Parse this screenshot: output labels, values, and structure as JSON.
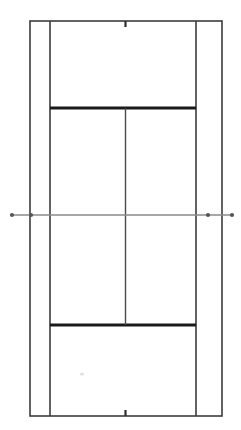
{
  "figure": {
    "orientation": "vertical",
    "surface_color": "#ffffff",
    "line_color": "#3c3c3c",
    "bold_line_color": "#1a1a1a",
    "net_color": "#8a8a8a",
    "canvas": {
      "width": 241,
      "height": 430
    }
  },
  "chart_data": {
    "type": "diagram",
    "view": "overhead-plan",
    "units": "pixels",
    "axis_ranges": {
      "x": [
        0,
        241
      ],
      "y": [
        0,
        430
      ]
    },
    "grid": false,
    "legend": null,
    "court_bounds": {
      "doubles_left_x": 30,
      "doubles_right_x": 222,
      "singles_left_x": 50,
      "singles_right_x": 196,
      "baseline_top_y": 21,
      "baseline_bottom_y": 416,
      "net_y": 215,
      "center_x": 125.5
    },
    "lines": [
      {
        "name": "doubles-sideline-left",
        "kind": "vertical",
        "x": 30,
        "y1": 21,
        "y2": 416,
        "weight": "normal"
      },
      {
        "name": "doubles-sideline-right",
        "kind": "vertical",
        "x": 222,
        "y1": 21,
        "y2": 416,
        "weight": "normal"
      },
      {
        "name": "singles-sideline-left",
        "kind": "vertical",
        "x": 50,
        "y1": 21,
        "y2": 416,
        "weight": "normal"
      },
      {
        "name": "singles-sideline-right",
        "kind": "vertical",
        "x": 196,
        "y1": 21,
        "y2": 416,
        "weight": "normal"
      },
      {
        "name": "baseline-top",
        "kind": "horizontal",
        "y": 21,
        "x1": 30,
        "x2": 222,
        "weight": "normal"
      },
      {
        "name": "baseline-bottom",
        "kind": "horizontal",
        "y": 416,
        "x1": 30,
        "x2": 222,
        "weight": "normal"
      },
      {
        "name": "service-line-top",
        "kind": "horizontal",
        "y": 108,
        "x1": 50,
        "x2": 196,
        "weight": "bold"
      },
      {
        "name": "service-line-bottom",
        "kind": "horizontal",
        "y": 325,
        "x1": 50,
        "x2": 196,
        "weight": "bold"
      },
      {
        "name": "center-service-line",
        "kind": "vertical",
        "x": 125.5,
        "y1": 108,
        "y2": 325,
        "weight": "normal"
      },
      {
        "name": "net-line",
        "kind": "horizontal",
        "y": 215,
        "x1": 12,
        "x2": 233,
        "weight": "net"
      }
    ],
    "center_marks": [
      {
        "name": "center-mark-top",
        "x": 125.5,
        "y1": 21,
        "y2": 27
      },
      {
        "name": "center-mark-bottom",
        "x": 125.5,
        "y1": 410,
        "y2": 416
      }
    ],
    "net_posts": [
      {
        "name": "net-post-outer-left",
        "x": 12,
        "y": 215,
        "r": 2.1
      },
      {
        "name": "net-post-inner-left",
        "x": 31,
        "y": 215,
        "r": 2.1
      },
      {
        "name": "net-post-inner-right",
        "x": 208,
        "y": 215,
        "r": 2.1
      },
      {
        "name": "net-post-outer-right",
        "x": 232,
        "y": 215,
        "r": 2.1
      }
    ],
    "regions": [
      {
        "name": "deuce-court-far",
        "x1": 50,
        "x2": 125.5,
        "y1": 108,
        "y2": 215
      },
      {
        "name": "ad-court-far",
        "x1": 125.5,
        "x2": 196,
        "y1": 108,
        "y2": 215
      },
      {
        "name": "deuce-court-near",
        "x1": 125.5,
        "x2": 196,
        "y1": 215,
        "y2": 325
      },
      {
        "name": "ad-court-near",
        "x1": 50,
        "x2": 125.5,
        "y1": 215,
        "y2": 325
      },
      {
        "name": "backcourt-far",
        "x1": 50,
        "x2": 196,
        "y1": 21,
        "y2": 108
      },
      {
        "name": "backcourt-near",
        "x1": 50,
        "x2": 196,
        "y1": 325,
        "y2": 416
      },
      {
        "name": "doubles-alley-left",
        "x1": 30,
        "x2": 50,
        "y1": 21,
        "y2": 416
      },
      {
        "name": "doubles-alley-right",
        "x1": 196,
        "x2": 222,
        "y1": 21,
        "y2": 416
      }
    ],
    "marks": [
      {
        "name": "court-smudge",
        "x": 82,
        "y": 374,
        "rx": 2.2,
        "ry": 1.6
      }
    ]
  }
}
